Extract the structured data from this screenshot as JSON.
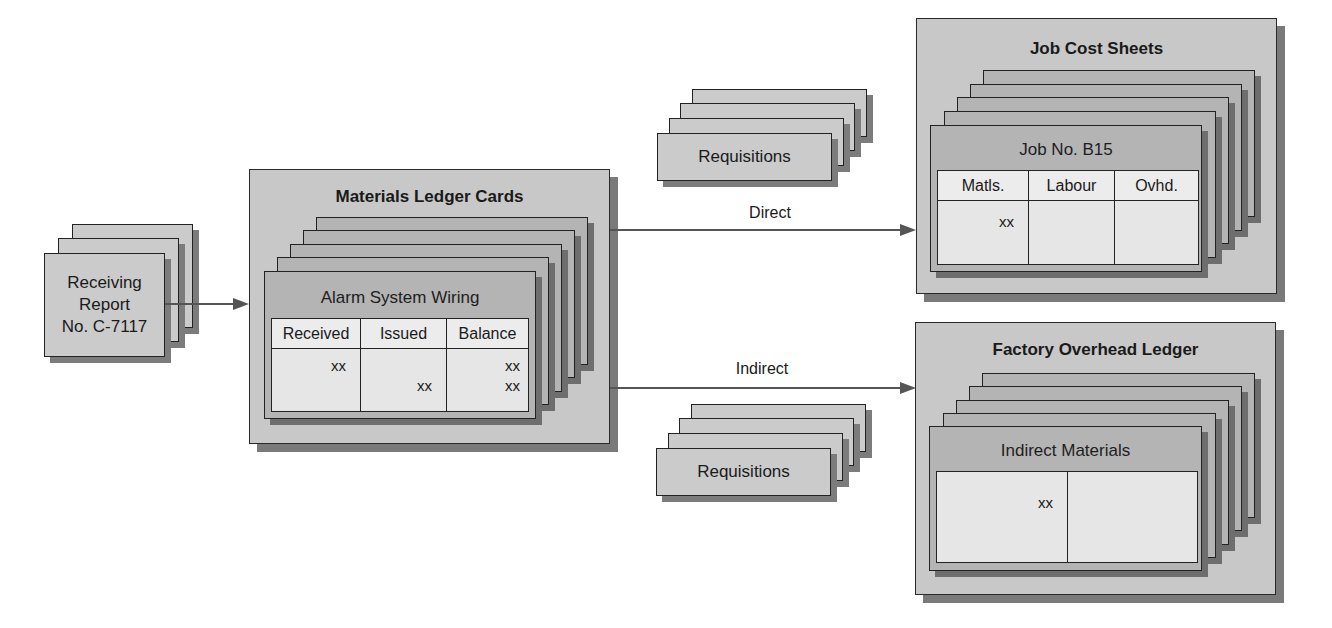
{
  "receiving_report": {
    "lines": [
      "Receiving",
      "Report",
      "No. C-7117"
    ]
  },
  "materials_ledger": {
    "title": "Materials Ledger Cards",
    "card_title": "Alarm System Wiring",
    "columns": [
      "Received",
      "Issued",
      "Balance"
    ],
    "entries": {
      "received": [
        "xx"
      ],
      "issued": [
        "xx"
      ],
      "balance": [
        "xx",
        "xx"
      ]
    }
  },
  "flows": {
    "direct_label": "Direct",
    "indirect_label": "Indirect"
  },
  "requisitions": {
    "top_label": "Requisitions",
    "bottom_label": "Requisitions"
  },
  "job_cost_sheets": {
    "title": "Job Cost Sheets",
    "card_title": "Job No. B15",
    "columns": [
      "Matls.",
      "Labour",
      "Ovhd."
    ],
    "entries": {
      "matls": "xx"
    }
  },
  "factory_overhead": {
    "title": "Factory Overhead Ledger",
    "card_title": "Indirect Materials",
    "entries": {
      "debit": "xx"
    }
  },
  "colors": {
    "outer_fill": "#c8c8c8",
    "card_fill": "#b4b4b4",
    "table_fill": "#e9e9e9",
    "shadow": "#7a7a7a",
    "arrow": "#555555"
  }
}
